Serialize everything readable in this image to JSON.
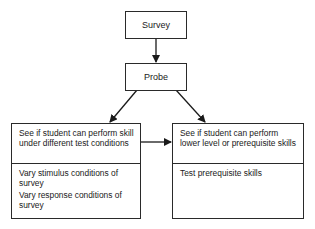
{
  "diagram": {
    "nodes": {
      "survey": {
        "label": "Survey"
      },
      "probe": {
        "label": "Probe"
      },
      "left": {
        "header": "See if student can perform skill under different test conditions",
        "items": [
          "Vary stimulus conditions of survey",
          "Vary response conditions of survey"
        ]
      },
      "right": {
        "header": "See if student can perform lower level or prerequisite skills",
        "items": [
          "Test prerequisite skills"
        ]
      }
    },
    "edges": [
      {
        "from": "survey",
        "to": "probe"
      },
      {
        "from": "probe",
        "to": "left"
      },
      {
        "from": "probe",
        "to": "right"
      },
      {
        "from": "left",
        "to": "right"
      }
    ]
  }
}
